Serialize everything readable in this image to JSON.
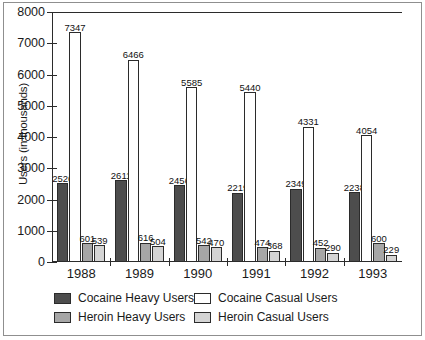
{
  "chart_data": {
    "type": "bar",
    "title": "",
    "subtitle": "",
    "xlabel": "",
    "ylabel": "Users (in thousands)",
    "categories": [
      "1988",
      "1989",
      "1990",
      "1991",
      "1992",
      "1993"
    ],
    "ylim": [
      0,
      8000
    ],
    "yticks": [
      "0",
      "1000",
      "2000",
      "3000",
      "4000",
      "5000",
      "6000",
      "7000",
      "8000"
    ],
    "ytick_values": [
      0,
      1000,
      2000,
      3000,
      4000,
      5000,
      6000,
      7000,
      8000
    ],
    "grid": false,
    "legend_position": "bottom",
    "series": [
      {
        "name": "Cocaine Heavy Users",
        "color": "#4d4d4d",
        "values": [
          2526,
          2611,
          2456,
          2219,
          2349,
          2238
        ]
      },
      {
        "name": "Cocaine Casual Users",
        "color": "#ffffff",
        "values": [
          7347,
          6466,
          5585,
          5440,
          4331,
          4054
        ]
      },
      {
        "name": "Heroin Heavy Users",
        "color": "#a6a6a6",
        "values": [
          601,
          616,
          542,
          474,
          452,
          600
        ]
      },
      {
        "name": "Heroin Casual Users",
        "color": "#d4d4d4",
        "values": [
          539,
          504,
          470,
          368,
          290,
          229
        ]
      }
    ]
  },
  "colors": {
    "axis": "#2b2b2b",
    "frame": "#8f8f8f",
    "text": "#1a1a1a",
    "cocaine_heavy": "#4d4d4d",
    "cocaine_casual": "#ffffff",
    "heroin_heavy": "#a6a6a6",
    "heroin_casual": "#d4d4d4"
  }
}
